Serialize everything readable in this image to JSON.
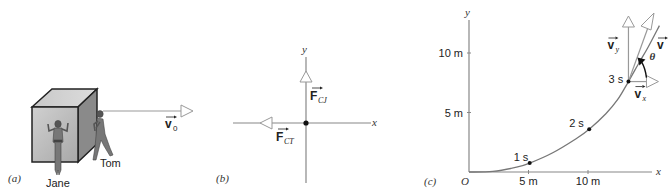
{
  "panels": {
    "a": {
      "label": "(a)",
      "people": [
        "Jane",
        "Tom"
      ],
      "velocity_label": "v",
      "velocity_subscript": "0"
    },
    "b": {
      "label": "(b)",
      "x_axis": "x",
      "y_axis": "y",
      "force_up": {
        "symbol": "F",
        "subscript": "CJ"
      },
      "force_left": {
        "symbol": "F",
        "subscript": "CT"
      }
    },
    "c": {
      "label": "(c)",
      "origin": "O",
      "x_axis": "x",
      "y_axis": "y",
      "angle_label": "θ",
      "velocity": {
        "symbol": "v"
      },
      "velocity_y": {
        "symbol": "v",
        "subscript": "y"
      },
      "velocity_x": {
        "symbol": "v",
        "subscript": "x"
      }
    }
  },
  "chart_data": {
    "type": "line",
    "title": "",
    "xlabel": "x",
    "ylabel": "y",
    "x_ticks": [
      {
        "value": 5,
        "label": "5 m"
      },
      {
        "value": 10,
        "label": "10 m"
      }
    ],
    "y_ticks": [
      {
        "value": 5,
        "label": "5 m"
      },
      {
        "value": 10,
        "label": "10 m"
      }
    ],
    "xlim": [
      0,
      15
    ],
    "ylim": [
      0,
      13
    ],
    "points": [
      {
        "t": "1 s",
        "x": 5.1,
        "y": 0.75
      },
      {
        "t": "2 s",
        "x": 10.1,
        "y": 3.6
      },
      {
        "t": "3 s",
        "x": 13.4,
        "y": 7.6
      }
    ],
    "curve": [
      [
        0,
        0
      ],
      [
        2,
        0.05
      ],
      [
        4,
        0.4
      ],
      [
        5.1,
        0.75
      ],
      [
        7,
        1.6
      ],
      [
        9,
        2.8
      ],
      [
        10.1,
        3.6
      ],
      [
        11.5,
        4.9
      ],
      [
        12.5,
        6.1
      ],
      [
        13.4,
        7.6
      ],
      [
        14.3,
        9.2
      ],
      [
        15,
        10.4
      ],
      [
        16,
        12.3
      ]
    ]
  }
}
